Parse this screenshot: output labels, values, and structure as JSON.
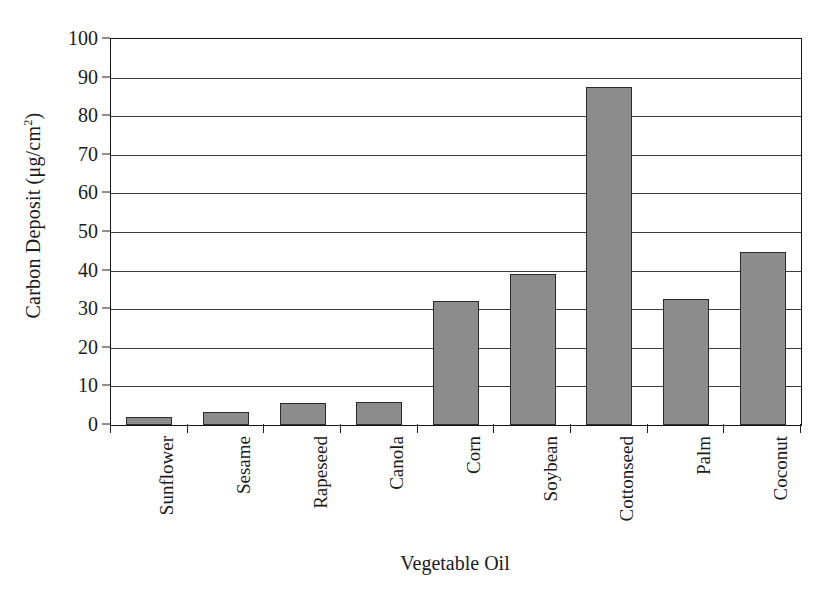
{
  "chart_data": {
    "type": "bar",
    "title": "",
    "xlabel": "Vegetable Oil",
    "ylabel_text": "Carbon Deposit (μg/cm",
    "ylabel_sup": "2",
    "ylabel_tail": ")",
    "ylabel_full": "Carbon Deposit (μg/cm2)",
    "categories": [
      "Sunflower",
      "Sesame",
      "Rapeseed",
      "Canola",
      "Corn",
      "Soybean",
      "Cottonseed",
      "Palm",
      "Coconut"
    ],
    "values": [
      2,
      3.5,
      5.8,
      6,
      32,
      39.2,
      87.5,
      32.7,
      44.7
    ],
    "ylim": [
      0,
      100
    ],
    "ytick_step": 10,
    "yticks": [
      100,
      90,
      80,
      70,
      60,
      50,
      40,
      30,
      20,
      10,
      0
    ],
    "ytick_labels": [
      "100",
      "90",
      "80",
      "70",
      "60",
      "50",
      "40",
      "30",
      "20",
      "10",
      "0"
    ],
    "grid": true,
    "legend": "none",
    "bar_color": "#8c8c8c",
    "bar_edge_color": "#2b2b2b",
    "axis_color": "#161616",
    "grid_color": "#3d3d3d"
  }
}
